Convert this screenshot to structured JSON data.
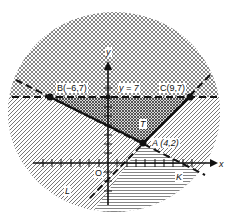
{
  "diagram": {
    "title": "",
    "axes": {
      "x_label": "x",
      "y_label": "y",
      "origin_label": "O"
    },
    "points": [
      {
        "name": "B",
        "label": "B(−6,7)",
        "x": -6,
        "y": 7
      },
      {
        "name": "C",
        "label": "C(9,7)",
        "x": 9,
        "y": 7
      },
      {
        "name": "A",
        "label": "A (4,2)",
        "x": 4,
        "y": 2
      }
    ],
    "lines": [
      {
        "name": "horizontal",
        "label": "y = 7",
        "style": "dashed"
      },
      {
        "name": "K",
        "label": "K",
        "style": "dashed",
        "through": [
          "B",
          "A"
        ]
      },
      {
        "name": "L",
        "label": "L",
        "style": "dashed",
        "through": [
          "C",
          "A"
        ]
      }
    ],
    "regions": [
      {
        "name": "T",
        "label": "T",
        "description": "triangle bounded by B, C, A"
      }
    ],
    "colors": {
      "ink": "#111111",
      "background": "#ffffff",
      "hatch": "#555555"
    }
  }
}
